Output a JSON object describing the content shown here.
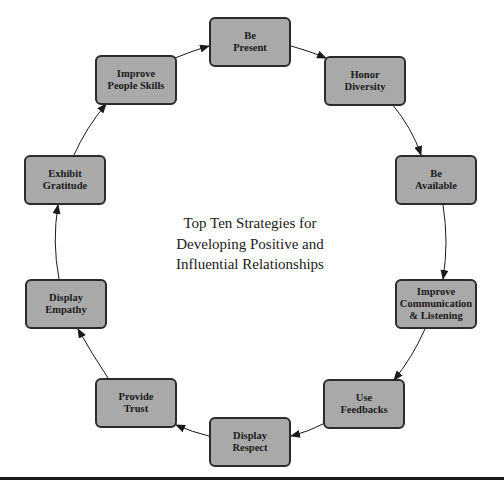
{
  "diagram": {
    "title_lines": [
      "Top Ten Strategies for",
      "Developing Positive and",
      "Influential Relationships"
    ],
    "node_fill": "#a9a9a9",
    "node_border": "#2b2b2b",
    "nodes": [
      {
        "id": "be-present",
        "label": "Be\nPresent",
        "x": 209,
        "y": 17
      },
      {
        "id": "honor-diversity",
        "label": "Honor\nDiversity",
        "x": 324,
        "y": 56
      },
      {
        "id": "be-available",
        "label": "Be\nAvailable",
        "x": 395,
        "y": 155
      },
      {
        "id": "improve-communication",
        "label": "Improve\nCommunication\n& Listening",
        "x": 395,
        "y": 279
      },
      {
        "id": "use-feedbacks",
        "label": "Use\nFeedbacks",
        "x": 323,
        "y": 379
      },
      {
        "id": "display-respect",
        "label": "Display\nRespect",
        "x": 209,
        "y": 417
      },
      {
        "id": "provide-trust",
        "label": "Provide\nTrust",
        "x": 95,
        "y": 378
      },
      {
        "id": "display-empathy",
        "label": "Display\nEmpathy",
        "x": 25,
        "y": 279
      },
      {
        "id": "exhibit-gratitude",
        "label": "Exhibit\nGratitude",
        "x": 24,
        "y": 155
      },
      {
        "id": "improve-people-skills",
        "label": "Improve\nPeople Skills",
        "x": 95,
        "y": 55
      }
    ],
    "edges": [
      {
        "from": "be-present",
        "to": "honor-diversity"
      },
      {
        "from": "honor-diversity",
        "to": "be-available"
      },
      {
        "from": "be-available",
        "to": "improve-communication"
      },
      {
        "from": "improve-communication",
        "to": "use-feedbacks"
      },
      {
        "from": "use-feedbacks",
        "to": "display-respect"
      },
      {
        "from": "display-respect",
        "to": "provide-trust"
      },
      {
        "from": "provide-trust",
        "to": "display-empathy"
      },
      {
        "from": "display-empathy",
        "to": "exhibit-gratitude"
      },
      {
        "from": "exhibit-gratitude",
        "to": "improve-people-skills"
      },
      {
        "from": "improve-people-skills",
        "to": "be-present"
      }
    ]
  }
}
